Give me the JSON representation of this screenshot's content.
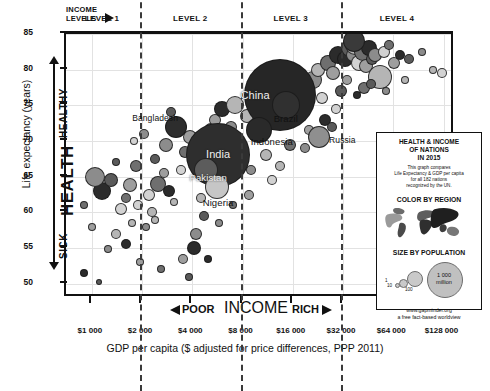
{
  "chart_data": {
    "type": "scatter",
    "title": "Gapminder World 2015",
    "xlabel": "GDP per capita ($ adjusted for price differences, PPP 2011)",
    "ylabel": "Life expectancy (years)",
    "xscale": "log",
    "xlim": [
      700,
      150000
    ],
    "ylim": [
      48,
      85
    ],
    "grid": true,
    "legend_position": "inside-bottom-right",
    "xticks": [
      "$1 000",
      "$2 000",
      "$4 000",
      "$8 000",
      "$16 000",
      "$32 000",
      "$64 000",
      "$128 000"
    ],
    "xtick_values": [
      1000,
      2000,
      4000,
      8000,
      16000,
      32000,
      64000,
      128000
    ],
    "yticks": [
      "50",
      "55",
      "60",
      "65",
      "70",
      "75",
      "80",
      "85"
    ],
    "ytick_values": [
      50,
      55,
      60,
      65,
      70,
      75,
      80,
      85
    ],
    "income_levels": [
      {
        "label": "LEVEL 1",
        "range": [
          700,
          2000
        ]
      },
      {
        "label": "LEVEL 2",
        "range": [
          2000,
          8000
        ]
      },
      {
        "label": "LEVEL 3",
        "range": [
          8000,
          32000
        ]
      },
      {
        "label": "LEVEL 4",
        "range": [
          32000,
          150000
        ]
      }
    ],
    "level_dividers": [
      2000,
      8000,
      32000
    ],
    "annotations": {
      "y_axis_top": "HEALTHY",
      "y_axis_mid": "HEALTH",
      "y_axis_bottom": "SICK",
      "x_axis_left": "POOR",
      "x_axis_center": "INCOME",
      "x_axis_right": "RICH",
      "income_levels_header": "INCOME LEVELS"
    },
    "labeled_points": [
      {
        "name": "Japan",
        "gdp": 37000,
        "life": 84.0,
        "population": 127
      },
      {
        "name": "China",
        "gdp": 13500,
        "life": 76.5,
        "population": 1400
      },
      {
        "name": "Brazil",
        "gdp": 14500,
        "life": 75.0,
        "population": 208
      },
      {
        "name": "Russia",
        "gdp": 23000,
        "life": 70.5,
        "population": 144
      },
      {
        "name": "Indonesia",
        "gdp": 10000,
        "life": 71.5,
        "population": 258
      },
      {
        "name": "Bangladesh",
        "gdp": 3200,
        "life": 72.0,
        "population": 161
      },
      {
        "name": "India",
        "gdp": 5700,
        "life": 68.0,
        "population": 1310
      },
      {
        "name": "Pakistan",
        "gdp": 4800,
        "life": 66.0,
        "population": 189
      },
      {
        "name": "Nigeria",
        "gdp": 5600,
        "life": 63.5,
        "population": 182
      }
    ],
    "points": [
      [
        900,
        51.5,
        4
      ],
      [
        1100,
        50.2,
        3
      ],
      [
        1250,
        54.8,
        4
      ],
      [
        1400,
        57.0,
        5
      ],
      [
        1500,
        60.5,
        6
      ],
      [
        1600,
        62.0,
        5
      ],
      [
        1700,
        63.8,
        7
      ],
      [
        1150,
        63.0,
        9
      ],
      [
        1300,
        64.5,
        7
      ],
      [
        1050,
        65.0,
        10
      ],
      [
        1750,
        58.5,
        4
      ],
      [
        1900,
        61.0,
        5
      ],
      [
        1850,
        66.5,
        6
      ],
      [
        1950,
        53.0,
        4
      ],
      [
        1600,
        55.5,
        5
      ],
      [
        1400,
        67.0,
        4
      ],
      [
        2100,
        58.0,
        4
      ],
      [
        2300,
        60.0,
        5
      ],
      [
        2200,
        62.5,
        6
      ],
      [
        2500,
        64.0,
        8
      ],
      [
        2700,
        65.5,
        5
      ],
      [
        2900,
        63.0,
        6
      ],
      [
        2400,
        67.5,
        5
      ],
      [
        2800,
        69.5,
        7
      ],
      [
        3100,
        61.5,
        4
      ],
      [
        3400,
        66.0,
        5
      ],
      [
        3600,
        68.5,
        6
      ],
      [
        3900,
        70.5,
        7
      ],
      [
        3300,
        72.5,
        6
      ],
      [
        3000,
        74.0,
        5
      ],
      [
        4200,
        57.0,
        6
      ],
      [
        4500,
        62.0,
        5
      ],
      [
        4800,
        69.0,
        6
      ],
      [
        5200,
        71.5,
        7
      ],
      [
        5500,
        73.0,
        6
      ],
      [
        6000,
        74.5,
        8
      ],
      [
        6400,
        70.0,
        7
      ],
      [
        6800,
        72.0,
        6
      ],
      [
        7200,
        75.0,
        9
      ],
      [
        7600,
        66.5,
        5
      ],
      [
        2600,
        52.0,
        4
      ],
      [
        3500,
        53.5,
        5
      ],
      [
        4100,
        55.0,
        7
      ],
      [
        4700,
        59.5,
        5
      ],
      [
        5800,
        58.5,
        4
      ],
      [
        8500,
        73.5,
        7
      ],
      [
        9200,
        75.5,
        8
      ],
      [
        9800,
        71.0,
        6
      ],
      [
        10500,
        76.0,
        9
      ],
      [
        11500,
        74.0,
        7
      ],
      [
        12500,
        77.0,
        8
      ],
      [
        13000,
        72.5,
        6
      ],
      [
        14000,
        78.0,
        7
      ],
      [
        15000,
        76.5,
        9
      ],
      [
        16500,
        74.5,
        6
      ],
      [
        17500,
        79.0,
        7
      ],
      [
        18500,
        77.5,
        8
      ],
      [
        19500,
        75.5,
        6
      ],
      [
        21000,
        78.5,
        9
      ],
      [
        22500,
        80.0,
        7
      ],
      [
        24000,
        76.0,
        6
      ],
      [
        26000,
        81.0,
        8
      ],
      [
        28000,
        79.5,
        7
      ],
      [
        30000,
        82.0,
        9
      ],
      [
        31000,
        77.0,
        6
      ],
      [
        9000,
        66.0,
        5
      ],
      [
        11000,
        68.0,
        6
      ],
      [
        12000,
        64.5,
        5
      ],
      [
        15500,
        69.5,
        6
      ],
      [
        20000,
        71.5,
        5
      ],
      [
        33000,
        81.5,
        8
      ],
      [
        35000,
        83.0,
        9
      ],
      [
        36500,
        82.0,
        7
      ],
      [
        38000,
        83.5,
        10
      ],
      [
        40000,
        81.0,
        8
      ],
      [
        42000,
        82.5,
        9
      ],
      [
        44000,
        80.5,
        7
      ],
      [
        46000,
        83.0,
        8
      ],
      [
        48000,
        81.5,
        6
      ],
      [
        50000,
        82.0,
        7
      ],
      [
        53000,
        79.0,
        12
      ],
      [
        56000,
        82.5,
        6
      ],
      [
        60000,
        83.5,
        5
      ],
      [
        65000,
        81.0,
        6
      ],
      [
        70000,
        82.0,
        5
      ],
      [
        80000,
        81.5,
        5
      ],
      [
        95000,
        82.5,
        4
      ],
      [
        110000,
        80.0,
        4
      ],
      [
        125000,
        79.5,
        5
      ],
      [
        43000,
        77.5,
        6
      ],
      [
        34000,
        78.5,
        5
      ],
      [
        39000,
        76.5,
        4
      ],
      [
        47000,
        78.0,
        5
      ],
      [
        58000,
        77.0,
        4
      ],
      [
        75000,
        78.5,
        4
      ],
      [
        6200,
        64.0,
        5
      ],
      [
        7000,
        61.0,
        4
      ],
      [
        8800,
        62.5,
        5
      ],
      [
        5000,
        53.5,
        4
      ],
      [
        3800,
        51.0,
        4
      ],
      [
        2050,
        71.0,
        5
      ],
      [
        2400,
        59.0,
        4
      ],
      [
        1800,
        70.0,
        4
      ],
      [
        900,
        61.0,
        4
      ],
      [
        1000,
        58.0,
        4
      ],
      [
        25000,
        73.0,
        6
      ],
      [
        27500,
        72.0,
        5
      ],
      [
        19000,
        69.0,
        5
      ],
      [
        13500,
        66.5,
        5
      ],
      [
        29000,
        74.5,
        5
      ]
    ]
  },
  "legend": {
    "title_line1": "HEALTH & INCOME",
    "title_line2": "OF NATIONS",
    "title_line3": "IN 2015",
    "desc_line1": "This graph compares",
    "desc_line2": "Life Expectancy & GDP per capita",
    "desc_line3": "for all 182 nations",
    "desc_line4": "recognized by the UN.",
    "color_heading": "COLOR BY REGION",
    "size_heading": "SIZE BY POPULATION",
    "size_small_1": "1",
    "size_small_10": "10",
    "size_small_100": "100",
    "size_big_line1": "1 000",
    "size_big_line2": "million",
    "url": "www.gapminder.org",
    "tagline": "a free fact-based worldview"
  }
}
